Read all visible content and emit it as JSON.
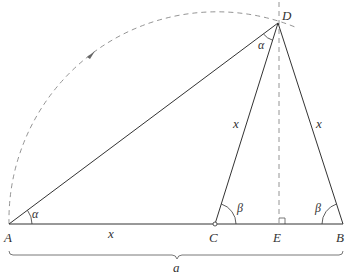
{
  "diagram": {
    "colors": {
      "stroke": "#333333",
      "dashed": "#777777",
      "background": "#ffffff"
    },
    "points": {
      "A": {
        "label": "A"
      },
      "B": {
        "label": "B"
      },
      "C": {
        "label": "C"
      },
      "D": {
        "label": "D"
      },
      "E": {
        "label": "E"
      }
    },
    "angles": {
      "alpha_at_A": "α",
      "alpha_at_D": "α",
      "beta_at_C": "β",
      "beta_at_B": "β"
    },
    "segments": {
      "AC": "x",
      "CD": "x",
      "DB": "x",
      "AB_brace": "a"
    },
    "elements": [
      "solid segment AB (base)",
      "solid segment AD",
      "solid segment CD",
      "solid segment DB",
      "dashed vertical line through D and E (altitude) with right-angle mark at E",
      "dashed arc centered at C from A to D with arrow",
      "brace under AB labeled a",
      "small circle marker at C"
    ]
  }
}
